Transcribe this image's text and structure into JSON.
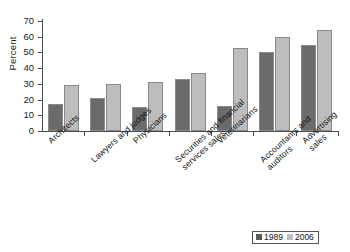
{
  "chart_data": {
    "type": "bar",
    "title": "",
    "xlabel": "",
    "ylabel": "Percent",
    "ylim": [
      0,
      70
    ],
    "yticks": [
      0,
      10,
      20,
      30,
      40,
      50,
      60,
      70
    ],
    "grid": false,
    "legend_position": "bottom-right",
    "categories": [
      "Architects",
      "Lawyers and judges",
      "Physicians",
      "Securities and financial\nservices sales",
      "Veterinarians",
      "Accountants and auditors",
      "Advertising sales"
    ],
    "series": [
      {
        "name": "1989",
        "color": "#6b6b6b",
        "values": [
          17,
          21,
          15,
          33,
          16,
          50,
          55
        ]
      },
      {
        "name": "2006",
        "color": "#bdbdbd",
        "values": [
          29,
          30,
          31,
          37,
          53,
          60,
          64
        ]
      }
    ]
  },
  "legend": {
    "items": [
      {
        "label": "1989"
      },
      {
        "label": "2006"
      }
    ]
  }
}
